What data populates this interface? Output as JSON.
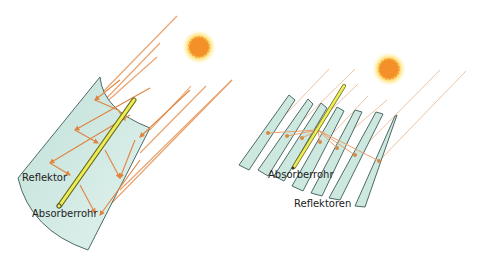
{
  "left_diagram": {
    "title": "Parabolic trough collector",
    "labels": {
      "reflector": "Reflektor",
      "absorber": "Absorberrohr"
    }
  },
  "right_diagram": {
    "title": "Fresnel collector",
    "labels": {
      "absorber": "Absorberrohr",
      "reflectors": "Reflektoren"
    }
  },
  "colors": {
    "ray": "#e8935a",
    "mirror_fill": "#cfe8e0",
    "mirror_stroke": "#4d6a66",
    "absorber": "#e6e64a",
    "sun_core": "#f0902a",
    "sun_glow": "#ffe27a"
  }
}
